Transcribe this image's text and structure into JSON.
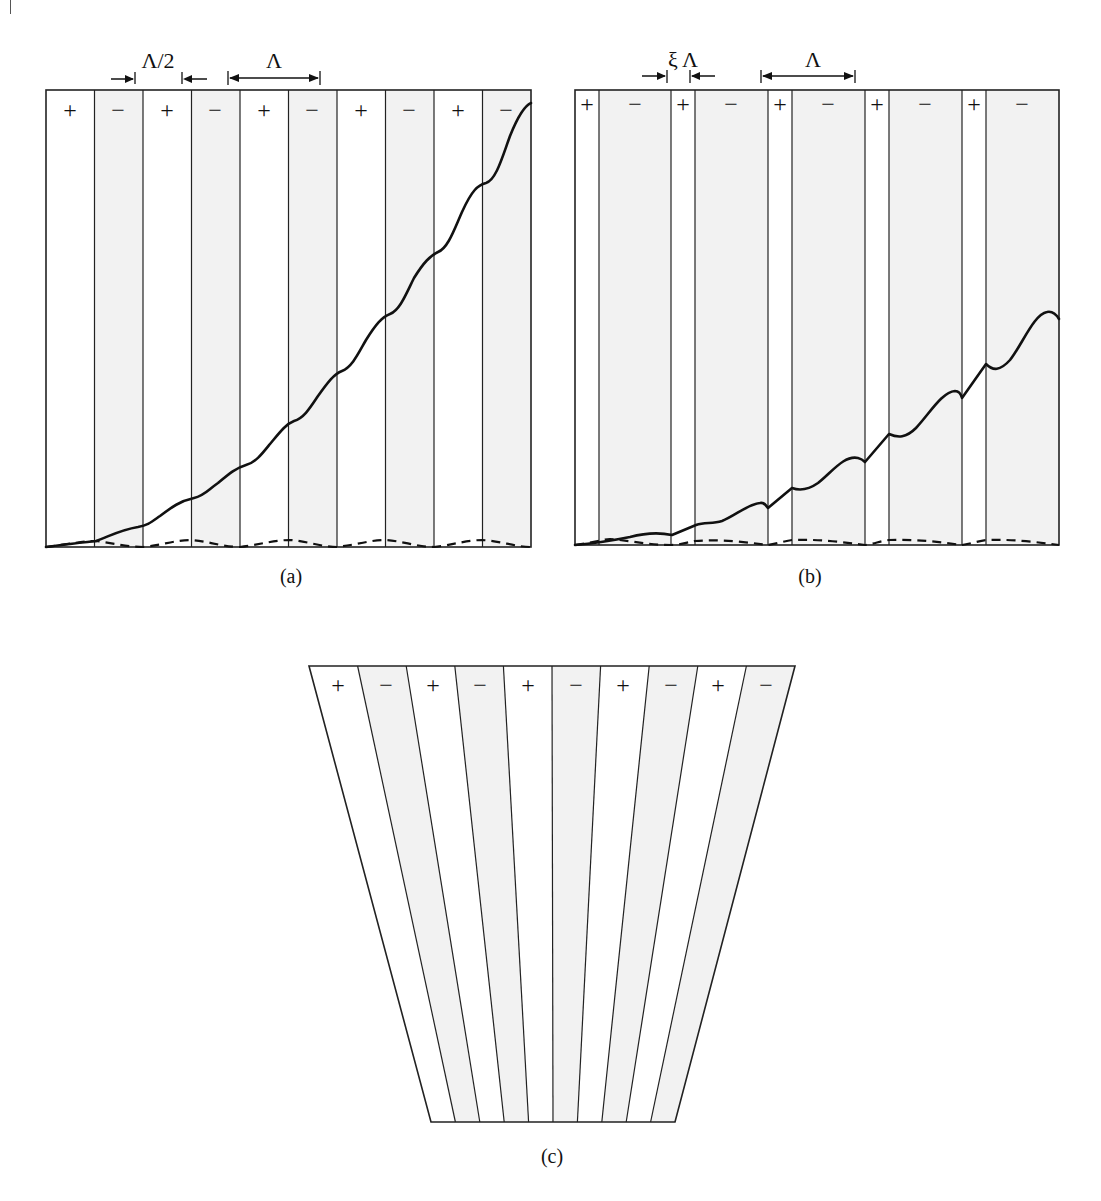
{
  "figure": {
    "panel_a": {
      "caption": "(a)",
      "domain_signs": [
        "+",
        "−",
        "+",
        "−",
        "+",
        "−",
        "+",
        "−",
        "+",
        "−"
      ],
      "half_period_label": "Λ/2",
      "period_label": "Λ",
      "description": "Periodically poled, 50% duty cycle; solid curve grows monotonically (quasi-phase-matched), dashed curve oscillates near zero (non-phase-matched)"
    },
    "panel_b": {
      "caption": "(b)",
      "domain_signs": [
        "+",
        "−",
        "+",
        "−",
        "+",
        "−",
        "+",
        "−",
        "+",
        "−"
      ],
      "duty_label": "ξ Λ",
      "period_label": "Λ",
      "description": "Periodically poled with reduced duty cycle ξ; solid curve grows more slowly with larger ripples"
    },
    "panel_c": {
      "caption": "(c)",
      "domain_signs": [
        "+",
        "−",
        "+",
        "−",
        "+",
        "−",
        "+",
        "−",
        "+",
        "−"
      ],
      "description": "Fan-out grating: domain boundaries tilt so that the period varies across the crystal width"
    },
    "colors": {
      "line": "#111111",
      "negative_domain_fill": "#f2f2f2",
      "positive_domain_fill": "#ffffff"
    }
  }
}
